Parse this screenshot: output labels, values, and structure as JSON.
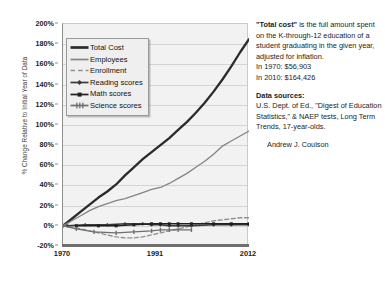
{
  "chart_data": {
    "type": "line",
    "title": "",
    "xlabel": "",
    "ylabel": "% Change Relative to Initial Year of Data",
    "xlim": [
      1970,
      2012
    ],
    "ylim": [
      -20,
      200
    ],
    "ytick_labels": [
      "200%",
      "180%",
      "160%",
      "140%",
      "120%",
      "100%",
      "80%",
      "60%",
      "40%",
      "20%",
      "0%",
      "-20%"
    ],
    "ytick_values": [
      200,
      180,
      160,
      140,
      120,
      100,
      80,
      60,
      40,
      20,
      0,
      -20
    ],
    "xtick_labels": [
      "1970",
      "1991",
      "2012"
    ],
    "xtick_values": [
      1970,
      1991,
      2012
    ],
    "grid": "horizontal",
    "legend_position": "upper-left-inside",
    "series": [
      {
        "name": "Total Cost",
        "style": "solid-thick-dark",
        "color": "#2b2b2b",
        "x": [
          1970,
          1972,
          1974,
          1976,
          1978,
          1980,
          1982,
          1984,
          1986,
          1988,
          1990,
          1992,
          1994,
          1996,
          1998,
          2000,
          2002,
          2004,
          2006,
          2008,
          2010,
          2012
        ],
        "values": [
          0,
          7,
          14,
          21,
          28,
          34,
          41,
          50,
          58,
          66,
          73,
          80,
          87,
          95,
          103,
          112,
          122,
          133,
          145,
          158,
          172,
          185
        ]
      },
      {
        "name": "Employees",
        "style": "solid-thin-gray",
        "color": "#848484",
        "x": [
          1970,
          1972,
          1974,
          1976,
          1978,
          1980,
          1982,
          1984,
          1986,
          1988,
          1990,
          1992,
          1994,
          1996,
          1998,
          2000,
          2002,
          2004,
          2006,
          2008,
          2010,
          2012
        ],
        "values": [
          0,
          5,
          10,
          15,
          19,
          22,
          25,
          27,
          30,
          33,
          36,
          38,
          42,
          47,
          52,
          58,
          64,
          71,
          79,
          84,
          89,
          94
        ]
      },
      {
        "name": "Enrollment",
        "style": "dashed-gray",
        "color": "#8f8f8f",
        "x": [
          1970,
          1972,
          1974,
          1976,
          1978,
          1980,
          1982,
          1984,
          1986,
          1988,
          1990,
          1992,
          1994,
          1996,
          1998,
          2000,
          2002,
          2004,
          2006,
          2008,
          2010,
          2012
        ],
        "values": [
          0,
          -1,
          -3,
          -5,
          -7,
          -9,
          -11,
          -12,
          -12,
          -11,
          -9,
          -7,
          -5,
          -3,
          -1,
          1,
          3,
          5,
          6,
          7,
          8,
          8
        ]
      },
      {
        "name": "Reading scores",
        "style": "marker-diamond-dark",
        "color": "#3a3a3a",
        "x": [
          1971,
          1975,
          1980,
          1984,
          1988,
          1990,
          1992,
          1994,
          1996,
          1999,
          2004,
          2008,
          2012
        ],
        "values": [
          0,
          1,
          1,
          2,
          2,
          1,
          1,
          0,
          0,
          0,
          1,
          1,
          1
        ]
      },
      {
        "name": "Math scores",
        "style": "marker-square-dark",
        "color": "#1f1f1f",
        "x": [
          1973,
          1978,
          1982,
          1986,
          1990,
          1992,
          1994,
          1996,
          1999,
          2004,
          2008,
          2012
        ],
        "values": [
          0,
          0,
          0,
          1,
          2,
          2,
          2,
          2,
          2,
          2,
          2,
          2
        ]
      },
      {
        "name": "Science scores",
        "style": "marker-tick-gray",
        "color": "#6e6e6e",
        "x": [
          1970,
          1973,
          1977,
          1982,
          1986,
          1990,
          1992,
          1994,
          1996,
          1999
        ],
        "values": [
          0,
          -3,
          -6,
          -7,
          -6,
          -5,
          -4,
          -4,
          -4,
          -4
        ]
      }
    ]
  },
  "legend": {
    "items": [
      {
        "label": "Total Cost"
      },
      {
        "label": "Employees"
      },
      {
        "label": "Enrollment"
      },
      {
        "label": "Reading scores"
      },
      {
        "label": "Math scores"
      },
      {
        "label": "Science scores"
      }
    ]
  },
  "notes": {
    "definition_term": "\"Total cost\"",
    "definition_body": " is the full amount spent on the K-through-12 education of a student graduating in the given year, adjusted for inflation.",
    "figure_1970": "In 1970:   $56,903",
    "figure_2010": "In 2010:  $164,426",
    "sources_heading": "Data sources:",
    "sources_body": "U.S. Dept. of Ed., \"Digest of Education Statistics,\" & NAEP tests, Long Term Trends, 17-year-olds.",
    "author": "Andrew J. Coulson"
  }
}
